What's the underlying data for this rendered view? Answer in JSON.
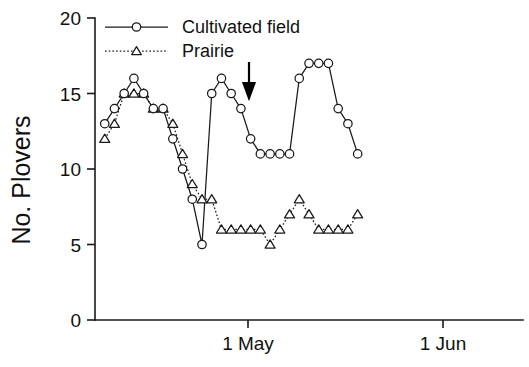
{
  "chart_data": {
    "type": "line",
    "title": "",
    "xlabel": "",
    "ylabel": "No. Plovers",
    "ylim": [
      0,
      20
    ],
    "yticks": [
      0,
      5,
      10,
      15,
      20
    ],
    "ytick_labels": [
      "0",
      "5",
      "10",
      "15",
      "20"
    ],
    "xlim": [
      0,
      44
    ],
    "xticks": [
      12,
      43
    ],
    "xtick_labels": [
      "1 May",
      "1 Jun"
    ],
    "grid": false,
    "legend_position": "top-left",
    "annotations": [
      {
        "name": "treatment-arrow",
        "type": "down-arrow",
        "x": 12,
        "y_from": 18.6,
        "y_to": 16.0,
        "label": ""
      }
    ],
    "series": [
      {
        "name": "Cultivated field",
        "marker": "circle",
        "line_style": "solid",
        "x": [
          1,
          2,
          3,
          4,
          5,
          6,
          7,
          8,
          9,
          10,
          11,
          12,
          13,
          14,
          15,
          16,
          17,
          18,
          19,
          20,
          21,
          22,
          23,
          24,
          25,
          26,
          27
        ],
        "values": [
          13,
          14,
          15,
          16,
          15,
          14,
          14,
          12,
          10,
          8,
          5,
          15,
          16,
          15,
          14,
          12,
          11,
          11,
          11,
          11,
          16,
          17,
          17,
          17,
          14,
          13,
          11
        ]
      },
      {
        "name": "Prairie",
        "marker": "triangle",
        "line_style": "dotted",
        "x": [
          1,
          2,
          3,
          4,
          5,
          6,
          7,
          8,
          9,
          10,
          11,
          12,
          13,
          14,
          15,
          16,
          17,
          18,
          19,
          20,
          21,
          22,
          23,
          24,
          25,
          26,
          27
        ],
        "values": [
          12,
          13,
          15,
          15,
          15,
          14,
          14,
          13,
          11,
          9,
          8,
          8,
          6,
          6,
          6,
          6,
          6,
          5,
          6,
          7,
          8,
          7,
          6,
          6,
          6,
          6,
          7
        ]
      }
    ]
  },
  "legend": {
    "entries": [
      {
        "label": "Cultivated field",
        "marker": "circle",
        "line_style": "solid"
      },
      {
        "label": "Prairie",
        "marker": "triangle",
        "line_style": "dotted"
      }
    ]
  },
  "axes": {
    "y_title": "No. Plovers",
    "y_tick_0": "0",
    "y_tick_1": "5",
    "y_tick_2": "10",
    "y_tick_3": "15",
    "y_tick_4": "20",
    "x_tick_0": "1 May",
    "x_tick_1": "1 Jun"
  }
}
